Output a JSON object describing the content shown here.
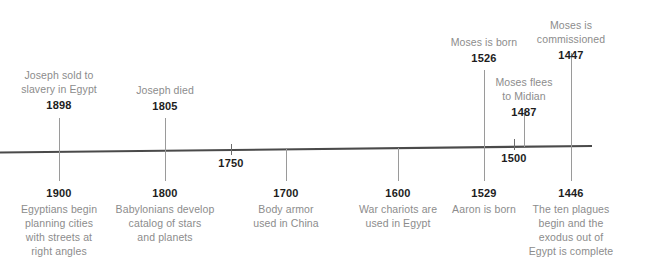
{
  "diagram": {
    "type": "timeline",
    "orientation": "horizontal",
    "direction": "descending-years-bc",
    "axis": {
      "start_x": 0,
      "end_x": 592,
      "color": "#4a4a4a"
    },
    "colors": {
      "description_text": "#8c8c8c",
      "year_text": "#1d1d1d",
      "axis": "#4a4a4a",
      "connector": "#9a9a9a",
      "background": "#ffffff"
    },
    "axis_ticks": [
      {
        "label": "1750",
        "x": 231
      },
      {
        "label": "1500",
        "x": 514
      }
    ],
    "events_above": [
      {
        "description": "Joseph sold to\nslavery in Egypt",
        "year": "1898",
        "x": 59
      },
      {
        "description": "Joseph died",
        "year": "1805",
        "x": 165
      },
      {
        "description": "Moses is born",
        "year": "1526",
        "x": 484
      },
      {
        "description": "Moses flees\nto Midian",
        "year": "1487",
        "x": 524
      },
      {
        "description": "Moses is\ncommissioned",
        "year": "1447",
        "x": 571
      }
    ],
    "events_below": [
      {
        "year": "1900",
        "description": "Egyptians begin\nplanning cities\nwith streets at\nright angles",
        "x": 59
      },
      {
        "year": "1800",
        "description": "Babylonians develop\ncatalog of stars\nand planets",
        "x": 165
      },
      {
        "year": "1700",
        "description": "Body armor\nused in China",
        "x": 286
      },
      {
        "year": "1600",
        "description": "War chariots are\nused in Egypt",
        "x": 398
      },
      {
        "year": "1529",
        "description": "Aaron is born",
        "x": 484
      },
      {
        "year": "1446",
        "description": "The ten plagues\nbegin and the\nexodus out of\nEgypt is complete",
        "x": 571
      }
    ]
  }
}
